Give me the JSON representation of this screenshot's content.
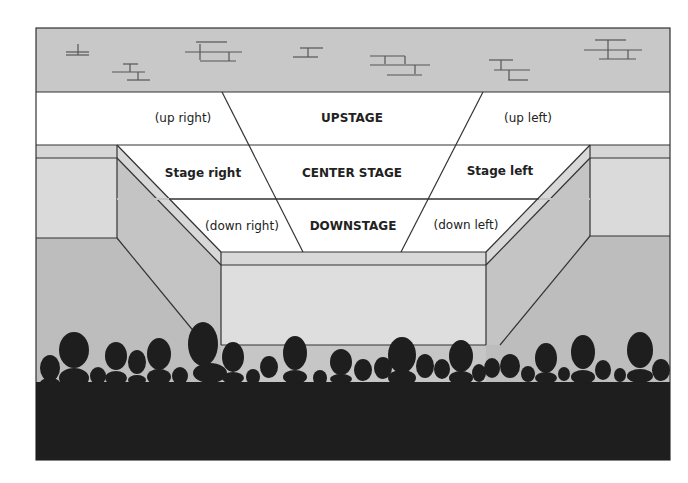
{
  "diagram": {
    "colors": {
      "backdrop": "#c8c8c8",
      "stage_floor": "#ffffff",
      "wing_top": "#d6d6d6",
      "wing_face": "#dcdcdc",
      "side_wall": "#c2c2c2",
      "floor_side": "#bdbdbd",
      "apron_top": "#d8d8d8",
      "apron_face": "#dedede",
      "audience": "#1e1e1e",
      "lines": "#333333",
      "text": "#222222"
    },
    "backdrop": {
      "label": "brick wall backdrop"
    },
    "areas": {
      "up_right": "(up right)",
      "upstage": "UPSTAGE",
      "up_left": "(up left)",
      "stage_right": "Stage right",
      "center_stage": "CENTER STAGE",
      "stage_left": "Stage left",
      "down_right": "(down right)",
      "downstage": "DOWNSTAGE",
      "down_left": "(down left)"
    },
    "audience": {
      "label": "audience silhouettes"
    }
  }
}
